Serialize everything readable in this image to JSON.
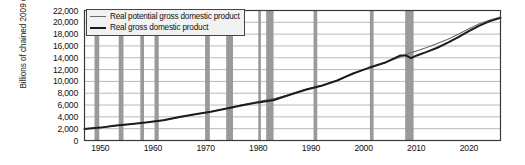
{
  "chart_data": {
    "type": "line",
    "title": "",
    "subtitle": "",
    "xlabel": "",
    "ylabel": "Billions of chained 2009 dollars",
    "xlim": [
      1947,
      2026
    ],
    "ylim": [
      0,
      22000
    ],
    "grid": true,
    "legend_position": "top-left",
    "y_ticks": [
      "0",
      "2,000",
      "4,000",
      "6,000",
      "8,000",
      "10,000",
      "12,000",
      "14,000",
      "16,000",
      "18,000",
      "20,000",
      "22,000"
    ],
    "y_tick_values": [
      0,
      2000,
      4000,
      6000,
      8000,
      10000,
      12000,
      14000,
      16000,
      18000,
      20000,
      22000
    ],
    "x_ticks": [
      "1950",
      "1960",
      "1970",
      "1980",
      "1990",
      "2000",
      "2010",
      "2020"
    ],
    "x_tick_values": [
      1950,
      1960,
      1970,
      1980,
      1990,
      2000,
      2010,
      2020
    ],
    "legend": [
      {
        "name": "Real potential gross domestic product",
        "color": "#6a6a6a",
        "style": "thin"
      },
      {
        "name": "Real gross domestic product",
        "color": "#1c1c1c",
        "style": "thick"
      }
    ],
    "series": [
      {
        "name": "Real potential gross domestic product",
        "color": "#6a6a6a",
        "x": [
          1947,
          1950,
          1953,
          1956,
          1959,
          1962,
          1965,
          1968,
          1971,
          1974,
          1977,
          1980,
          1983,
          1986,
          1989,
          1992,
          1995,
          1998,
          2001,
          2004,
          2007,
          2008,
          2009,
          2010,
          2012,
          2014,
          2016,
          2018,
          2020,
          2022,
          2024,
          2026
        ],
        "values": [
          1990,
          2180,
          2520,
          2800,
          3080,
          3440,
          3880,
          4400,
          4900,
          5450,
          6050,
          6600,
          7080,
          7800,
          8650,
          9350,
          10200,
          11200,
          12300,
          13150,
          14150,
          14550,
          14850,
          15150,
          15750,
          16400,
          17150,
          18000,
          18900,
          19750,
          20400,
          20900
        ]
      },
      {
        "name": "Real gross domestic product",
        "color": "#1c1c1c",
        "x": [
          1947,
          1950,
          1953,
          1956,
          1959,
          1962,
          1965,
          1968,
          1971,
          1974,
          1977,
          1980,
          1983,
          1986,
          1989,
          1992,
          1995,
          1998,
          2001,
          2004,
          2007,
          2008,
          2009,
          2010,
          2012,
          2014,
          2016,
          2018,
          2020,
          2022,
          2024,
          2026
        ],
        "values": [
          1930,
          2180,
          2550,
          2780,
          3070,
          3410,
          3970,
          4450,
          4850,
          5400,
          5950,
          6450,
          6850,
          7750,
          8600,
          9250,
          10150,
          11350,
          12300,
          13150,
          14400,
          14400,
          13950,
          14350,
          15000,
          15700,
          16550,
          17500,
          18500,
          19450,
          20200,
          20750
        ]
      }
    ],
    "recession_bands": [
      {
        "start": 1948.9,
        "end": 1949.8
      },
      {
        "start": 1953.5,
        "end": 1954.4
      },
      {
        "start": 1957.6,
        "end": 1958.3
      },
      {
        "start": 1960.3,
        "end": 1961.1
      },
      {
        "start": 1969.9,
        "end": 1970.8
      },
      {
        "start": 1973.9,
        "end": 1975.2
      },
      {
        "start": 1980.0,
        "end": 1980.5
      },
      {
        "start": 1981.5,
        "end": 1982.9
      },
      {
        "start": 1990.5,
        "end": 1991.2
      },
      {
        "start": 2001.2,
        "end": 2001.9
      },
      {
        "start": 2007.9,
        "end": 2009.5
      }
    ],
    "recession_color": "#9a9a9a",
    "grid_color": "#9b9b9b",
    "axis_color": "#3a3a3a",
    "background": "#ffffff"
  }
}
